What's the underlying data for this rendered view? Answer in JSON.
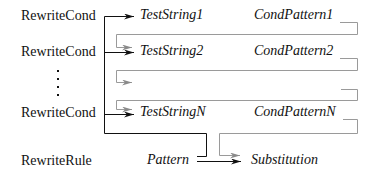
{
  "diagram": {
    "directives": [
      {
        "name": "RewriteCond",
        "test_string": "TestString1",
        "cond_pattern": "CondPattern1"
      },
      {
        "name": "RewriteCond",
        "test_string": "TestString2",
        "cond_pattern": "CondPattern2"
      },
      {
        "name": "RewriteCond",
        "test_string": "TestStringN",
        "cond_pattern": "CondPatternN"
      }
    ],
    "ellipsis": "⋮",
    "rule": {
      "name": "RewriteRule",
      "pattern": "Pattern",
      "substitution": "Substitution"
    },
    "colors": {
      "primary_line": "#111111",
      "feedback_line": "#9a9a9a"
    }
  }
}
